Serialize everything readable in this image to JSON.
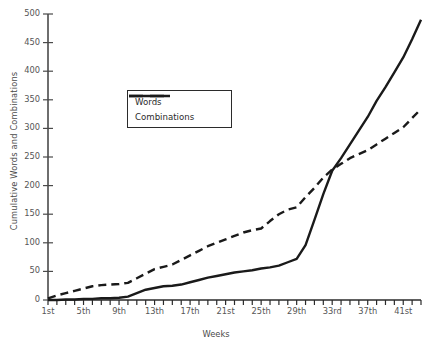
{
  "chart_data": {
    "type": "line",
    "title": "",
    "xlabel": "Weeks",
    "ylabel": "Cumulative Words and Combinations",
    "xlim": [
      1,
      43
    ],
    "ylim": [
      0,
      500
    ],
    "grid": false,
    "legend_position": "upper-left-inside",
    "y_ticks": [
      0,
      50,
      100,
      150,
      200,
      250,
      300,
      350,
      400,
      450,
      500
    ],
    "y_tick_labels": [
      "0",
      "50",
      "100",
      "150",
      "200",
      "250",
      "300",
      "350",
      "400",
      "450",
      "500"
    ],
    "x_ticks": [
      1,
      5,
      9,
      13,
      17,
      21,
      25,
      29,
      33,
      37,
      41
    ],
    "x_tick_labels": [
      "1st",
      "5th",
      "9th",
      "13th",
      "17th",
      "21st",
      "25th",
      "29th",
      "33rd",
      "37th",
      "41st"
    ],
    "x_minor_tick_every": 1,
    "x": [
      1,
      2,
      3,
      4,
      5,
      6,
      7,
      8,
      9,
      10,
      11,
      12,
      13,
      14,
      15,
      16,
      17,
      18,
      19,
      20,
      21,
      22,
      23,
      24,
      25,
      26,
      27,
      28,
      29,
      30,
      31,
      32,
      33,
      34,
      35,
      36,
      37,
      38,
      39,
      40,
      41,
      42,
      43
    ],
    "series": [
      {
        "name": "Words",
        "style": "dashed",
        "color": "#1a1a1a",
        "values": [
          3,
          8,
          12,
          16,
          20,
          24,
          26,
          27,
          28,
          30,
          38,
          46,
          54,
          58,
          62,
          70,
          78,
          86,
          94,
          100,
          106,
          112,
          118,
          122,
          125,
          138,
          150,
          158,
          162,
          180,
          196,
          214,
          228,
          238,
          248,
          255,
          262,
          272,
          282,
          292,
          302,
          318,
          334
        ]
      },
      {
        "name": "Combinations",
        "style": "solid",
        "color": "#1a1a1a",
        "values": [
          0,
          0,
          1,
          1,
          2,
          2,
          3,
          3,
          4,
          6,
          12,
          18,
          21,
          24,
          25,
          27,
          31,
          35,
          39,
          42,
          45,
          48,
          50,
          52,
          55,
          57,
          60,
          66,
          72,
          96,
          140,
          185,
          226,
          248,
          272,
          296,
          320,
          348,
          372,
          398,
          424,
          456,
          490
        ]
      }
    ],
    "annotations": {
      "crossover_note": "Combinations overtakes Words near week 32 at about 228"
    }
  },
  "legend": {
    "items": [
      {
        "label": "Words",
        "key": "dashed-line-key"
      },
      {
        "label": "Combinations",
        "key": "solid-line-key"
      }
    ]
  }
}
